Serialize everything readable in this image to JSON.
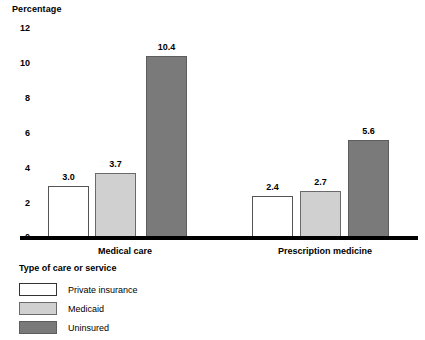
{
  "chart_data": {
    "type": "bar",
    "title": "",
    "ylabel": "Percentage",
    "xlabel": "Type of care or service",
    "ylim": [
      0,
      12
    ],
    "yticks": [
      "0",
      "2",
      "4",
      "6",
      "8",
      "10",
      "12"
    ],
    "grid": false,
    "legend_position": "below-left",
    "categories": [
      "Medical care",
      "Prescription medicine"
    ],
    "series": [
      {
        "name": "Private insurance",
        "color": "#ffffff",
        "values": [
          3.0,
          2.4
        ],
        "labels": [
          "3.0",
          "2.4"
        ]
      },
      {
        "name": "Medicaid",
        "color": "#d0d0d0",
        "values": [
          3.7,
          2.7
        ],
        "labels": [
          "3.7",
          "2.7"
        ]
      },
      {
        "name": "Uninsured",
        "color": "#7a7a7a",
        "values": [
          10.4,
          5.6
        ],
        "labels": [
          "10.4",
          "5.6"
        ]
      }
    ]
  },
  "axis": {
    "y_title": "Percentage",
    "ticks": [
      {
        "label": "12",
        "top": 24
      },
      {
        "label": "10",
        "top": 59
      },
      {
        "label": "8",
        "top": 94
      },
      {
        "label": "6",
        "top": 129
      },
      {
        "label": "4",
        "top": 164
      },
      {
        "label": "2",
        "top": 199
      },
      {
        "label": "0",
        "top": 233
      }
    ]
  },
  "groups": [
    {
      "label": "Medical care",
      "label_left": 55,
      "label_width": 140,
      "label_top": 247,
      "bars": [
        {
          "series": "Private insurance",
          "style": "private",
          "value": 3.0,
          "label": "3.0",
          "left": 48,
          "width": 41
        },
        {
          "series": "Medicaid",
          "style": "medicaid",
          "value": 3.7,
          "label": "3.7",
          "left": 95,
          "width": 41
        },
        {
          "series": "Uninsured",
          "style": "uninsured",
          "value": 10.4,
          "label": "10.4",
          "left": 146,
          "width": 41
        }
      ]
    },
    {
      "label": "Prescription medicine",
      "label_left": 250,
      "label_width": 150,
      "label_top": 247,
      "bars": [
        {
          "series": "Private insurance",
          "style": "private",
          "value": 2.4,
          "label": "2.4",
          "left": 252,
          "width": 41
        },
        {
          "series": "Medicaid",
          "style": "medicaid",
          "value": 2.7,
          "label": "2.7",
          "left": 300,
          "width": 41
        },
        {
          "series": "Uninsured",
          "style": "uninsured",
          "value": 5.6,
          "label": "5.6",
          "left": 348,
          "width": 41
        }
      ]
    }
  ],
  "legend": {
    "title": "Type of care or service",
    "items": [
      {
        "label": "Private insurance",
        "style": "private",
        "top": 283
      },
      {
        "label": "Medicaid",
        "style": "medicaid",
        "top": 302
      },
      {
        "label": "Uninsured",
        "style": "uninsured",
        "top": 321
      }
    ]
  }
}
